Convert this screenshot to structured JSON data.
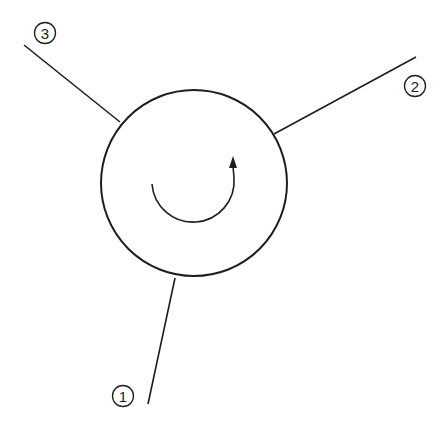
{
  "diagram": {
    "type": "rotary-valve-schematic",
    "colors": {
      "stroke": "#1e1e1e",
      "background": "#ffffff",
      "label_text": "#222222"
    },
    "body": {
      "shape": "circle",
      "center": [
        194,
        183
      ],
      "radius": 93
    },
    "rotation_arrow": {
      "direction": "counter-clockwise-sweep-ending-upward",
      "start": [
        152,
        184
      ],
      "end": [
        233,
        160
      ]
    },
    "ports": [
      {
        "id": "1",
        "label": "1",
        "line_start": [
          175,
          278
        ],
        "line_end": [
          148,
          404
        ],
        "label_position": [
          123,
          396
        ]
      },
      {
        "id": "2",
        "label": "2",
        "line_start": [
          274,
          134
        ],
        "line_end": [
          416,
          57
        ],
        "label_position": [
          415,
          86
        ]
      },
      {
        "id": "3",
        "label": "3",
        "line_start": [
          120,
          122
        ],
        "line_end": [
          24,
          45
        ],
        "label_position": [
          45,
          33
        ]
      }
    ]
  }
}
